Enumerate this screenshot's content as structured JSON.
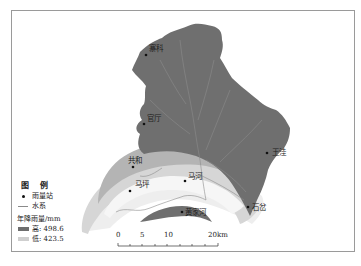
{
  "map": {
    "colors": {
      "high": "#6f6f6f",
      "mid": "#a9a9a9",
      "low_mid": "#d4d4d4",
      "low": "#efefef",
      "river": "#8c8c8c",
      "frame": "#9a9a9a"
    },
    "stations": [
      {
        "name": "寨科",
        "x": 146,
        "y": 54
      },
      {
        "name": "官厅",
        "x": 144,
        "y": 124
      },
      {
        "name": "王洼",
        "x": 267,
        "y": 152
      },
      {
        "name": "共和",
        "x": 131,
        "y": 164
      },
      {
        "name": "马河",
        "x": 185,
        "y": 179
      },
      {
        "name": "马坪",
        "x": 129,
        "y": 191
      },
      {
        "name": "黄家河",
        "x": 184,
        "y": 212
      },
      {
        "name": "石岔",
        "x": 247,
        "y": 206
      }
    ]
  },
  "legend": {
    "title": "图 例",
    "items": [
      {
        "symbol": "dot",
        "label": "雨量站"
      },
      {
        "symbol": "line",
        "label": "水系"
      }
    ],
    "rainfall_title": "年降雨量/mm",
    "high_label": "高: 498.6",
    "low_label": "低: 423.5"
  },
  "scale_bar": {
    "ticks": [
      "0",
      "5",
      "10",
      "20km"
    ]
  }
}
